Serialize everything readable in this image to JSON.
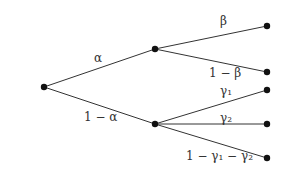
{
  "diagram": {
    "type": "probability-tree",
    "colors": {
      "edge": "#333333",
      "node": "#111111",
      "label": "#333333",
      "background": "#ffffff"
    },
    "nodes": [
      {
        "id": "root",
        "x": 44,
        "y": 87
      },
      {
        "id": "a",
        "x": 155,
        "y": 49
      },
      {
        "id": "b",
        "x": 155,
        "y": 124
      },
      {
        "id": "a1",
        "x": 267,
        "y": 26
      },
      {
        "id": "a2",
        "x": 267,
        "y": 72
      },
      {
        "id": "b1",
        "x": 267,
        "y": 90
      },
      {
        "id": "b2",
        "x": 267,
        "y": 124
      },
      {
        "id": "b3",
        "x": 267,
        "y": 158
      }
    ],
    "edges": [
      {
        "from": "root",
        "to": "a",
        "label": "α"
      },
      {
        "from": "root",
        "to": "b",
        "label": "1 − α"
      },
      {
        "from": "a",
        "to": "a1",
        "label": "β"
      },
      {
        "from": "a",
        "to": "a2",
        "label": "1 − β"
      },
      {
        "from": "b",
        "to": "b1",
        "label": "γ₁"
      },
      {
        "from": "b",
        "to": "b2",
        "label": "γ₂"
      },
      {
        "from": "b",
        "to": "b3",
        "label": "1 − γ₁ − γ₂"
      }
    ]
  }
}
